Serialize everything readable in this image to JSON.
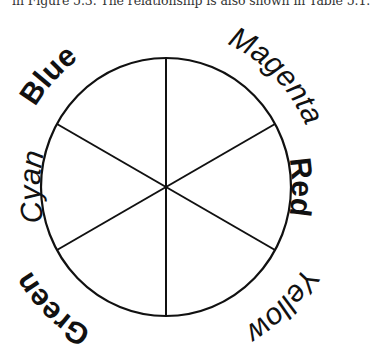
{
  "caption": {
    "text": "in Figure 5.3. The relationship is also shown in Table 5.1."
  },
  "color_wheel": {
    "center": [
      166,
      187
    ],
    "radius": 127,
    "spoke_angles_deg": [
      90,
      30,
      -30,
      -90,
      -150,
      150
    ],
    "labels": [
      {
        "name": "Blue",
        "style": "bold",
        "position": "top-left"
      },
      {
        "name": "Magenta",
        "style": "italic",
        "position": "top-right"
      },
      {
        "name": "Red",
        "style": "bold",
        "position": "right"
      },
      {
        "name": "Yellow",
        "style": "italic",
        "position": "bottom-right"
      },
      {
        "name": "Green",
        "style": "bold",
        "position": "bottom-left"
      },
      {
        "name": "Cyan",
        "style": "italic",
        "position": "left"
      }
    ],
    "stroke_color": "#111111"
  }
}
